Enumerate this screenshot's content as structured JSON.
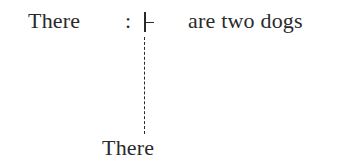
{
  "diagram": {
    "type": "linguistic-derivation",
    "top_row": {
      "subject": "There",
      "colon": ":",
      "operator_symbol": "⊢",
      "operator_name": "turnstile",
      "predicate": "are two dogs"
    },
    "connector": {
      "style": "dashed",
      "direction": "vertical"
    },
    "bottom_word": "There"
  },
  "colors": {
    "text": "#2a2a2a",
    "background": "#ffffff"
  }
}
